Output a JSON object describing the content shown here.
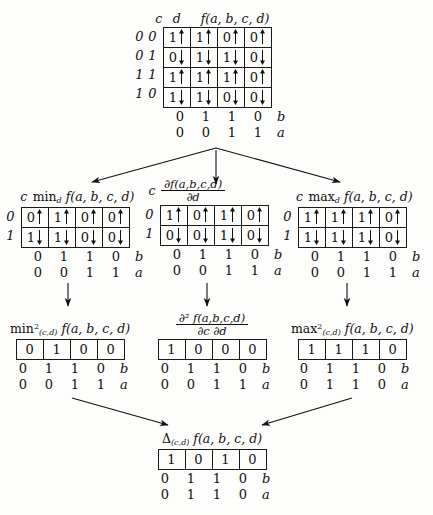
{
  "figure": {
    "row_var_labels": {
      "c": "c",
      "d": "d"
    },
    "bottom_var_b": "b",
    "bottom_var_a": "a"
  },
  "tables": {
    "f": {
      "caption_prefix": "",
      "caption_fn": "f(a, b, c, d)",
      "row_header": [
        "c",
        "d"
      ],
      "row_labels": [
        [
          "0",
          "0"
        ],
        [
          "0",
          "1"
        ],
        [
          "1",
          "1"
        ],
        [
          "1",
          "0"
        ]
      ],
      "cells": [
        [
          "1",
          "1",
          "0",
          "0"
        ],
        [
          "0",
          "1",
          "1",
          "0"
        ],
        [
          "1",
          "1",
          "1",
          "0"
        ],
        [
          "1",
          "1",
          "0",
          "0"
        ]
      ],
      "arrows": [
        "up",
        "down",
        "up",
        "down"
      ],
      "axis_b": [
        "0",
        "1",
        "1",
        "0"
      ],
      "axis_a": [
        "0",
        "0",
        "1",
        "1"
      ]
    },
    "min_d": {
      "caption_op": "min",
      "caption_sub": "d",
      "caption_fn": "f(a, b, c, d)",
      "row_header": [
        "c"
      ],
      "row_labels": [
        [
          "0"
        ],
        [
          "1"
        ]
      ],
      "cells": [
        [
          "0",
          "1",
          "0",
          "0"
        ],
        [
          "1",
          "1",
          "0",
          "0"
        ]
      ],
      "arrows": [
        "up",
        "down"
      ],
      "axis_b": [
        "0",
        "1",
        "1",
        "0"
      ],
      "axis_a": [
        "0",
        "0",
        "1",
        "1"
      ]
    },
    "deriv_d": {
      "caption_num": "∂f(a,b,c,d)",
      "caption_den": "∂d",
      "row_header": [
        "c"
      ],
      "row_labels": [
        [
          "0"
        ],
        [
          "1"
        ]
      ],
      "cells": [
        [
          "1",
          "0",
          "1",
          "0"
        ],
        [
          "0",
          "0",
          "1",
          "0"
        ]
      ],
      "arrows": [
        "up",
        "down"
      ],
      "axis_b": [
        "0",
        "1",
        "1",
        "0"
      ],
      "axis_a": [
        "0",
        "0",
        "1",
        "1"
      ]
    },
    "max_d": {
      "caption_op": "max",
      "caption_sub": "d",
      "caption_fn": "f(a, b, c, d)",
      "row_header": [
        "c"
      ],
      "row_labels": [
        [
          "0"
        ],
        [
          "1"
        ]
      ],
      "cells": [
        [
          "1",
          "1",
          "1",
          "0"
        ],
        [
          "1",
          "1",
          "1",
          "0"
        ]
      ],
      "arrows": [
        "up",
        "down"
      ],
      "axis_b": [
        "0",
        "1",
        "1",
        "0"
      ],
      "axis_a": [
        "0",
        "0",
        "1",
        "1"
      ]
    },
    "min2_cd": {
      "caption_op": "min",
      "caption_sup": "2",
      "caption_sub": "(c,d)",
      "caption_fn": "f(a, b, c, d)",
      "cells": [
        [
          "0",
          "1",
          "0",
          "0"
        ]
      ],
      "axis_b": [
        "0",
        "1",
        "1",
        "0"
      ],
      "axis_a": [
        "0",
        "0",
        "1",
        "1"
      ]
    },
    "deriv2_cd": {
      "caption_num": "∂² f(a,b,c,d)",
      "caption_den": "∂c ∂d",
      "cells": [
        [
          "1",
          "0",
          "0",
          "0"
        ]
      ],
      "axis_b": [
        "0",
        "1",
        "1",
        "0"
      ],
      "axis_a": [
        "0",
        "0",
        "1",
        "1"
      ]
    },
    "max2_cd": {
      "caption_op": "max",
      "caption_sup": "2",
      "caption_sub": "(c,d)",
      "caption_fn": "f(a, b, c, d)",
      "cells": [
        [
          "1",
          "1",
          "1",
          "0"
        ]
      ],
      "axis_b": [
        "0",
        "1",
        "1",
        "0"
      ],
      "axis_a": [
        "0",
        "1",
        "1",
        "0"
      ]
    },
    "delta_cd": {
      "caption_op": "Δ",
      "caption_sub": "(c,d)",
      "caption_fn": "f(a, b, c, d)",
      "cells": [
        [
          "1",
          "0",
          "1",
          "0"
        ]
      ],
      "axis_b": [
        "0",
        "1",
        "1",
        "0"
      ],
      "axis_a": [
        "0",
        "1",
        "1",
        "0"
      ]
    }
  }
}
